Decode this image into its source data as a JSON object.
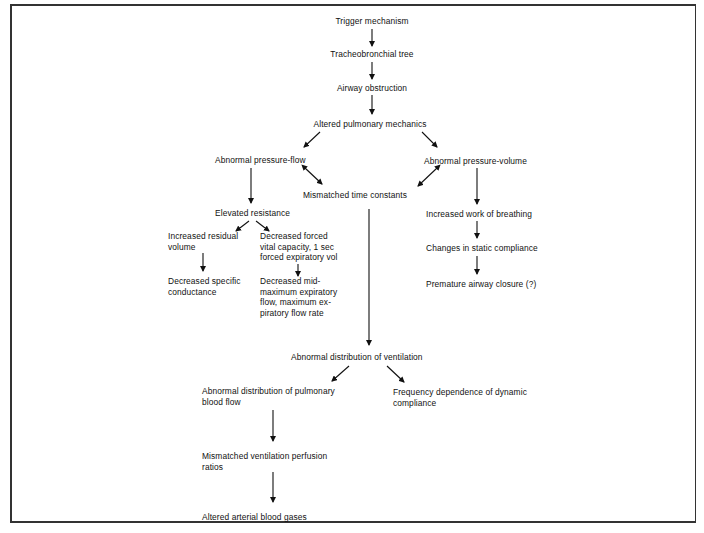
{
  "diagram": {
    "type": "flowchart",
    "nodes": {
      "trigger": "Trigger mechanism",
      "tracheo": "Tracheobronchial  tree",
      "airway": "Airway obstruction",
      "altered_mech": "Altered pulmonary mechanics",
      "abn_pf": "Abnormal pressure-flow",
      "abn_pv": "Abnormal pressure-volume",
      "mismatched_tc": "Mismatched time  constants",
      "elevated_res": "Elevated resistance",
      "inc_rv": "Increased residual\nvolume",
      "dec_fvc": "Decreased forced\nvital capacity, 1 sec\nforced expiratory vol",
      "dec_sc": "Decreased specific\nconductance",
      "dec_mmef": "Decreased mid-\nmaximum expiratory\nflow, maximum ex-\npiratory flow rate",
      "inc_wob": "Increased work  of breathing",
      "static_comp": "Changes in static compliance",
      "premature": "Premature airway closure (?)",
      "abn_dist_vent": "Abnormal distribution  of ventilation",
      "abn_dist_blood": "Abnormal distribution of pulmonary\nblood flow",
      "freq_dep": "Frequency dependence of dynamic\ncompliance",
      "mismatched_vp": "Mismatched ventilation perfusion\nratios",
      "altered_abg": "Altered arterial blood gases"
    },
    "edges": [
      [
        "trigger",
        "tracheo"
      ],
      [
        "tracheo",
        "airway"
      ],
      [
        "airway",
        "altered_mech"
      ],
      [
        "altered_mech",
        "abn_pf"
      ],
      [
        "altered_mech",
        "abn_pv"
      ],
      [
        "abn_pf",
        "mismatched_tc",
        "bidirectional"
      ],
      [
        "abn_pv",
        "mismatched_tc",
        "bidirectional"
      ],
      [
        "abn_pf",
        "elevated_res"
      ],
      [
        "elevated_res",
        "inc_rv"
      ],
      [
        "elevated_res",
        "dec_fvc"
      ],
      [
        "inc_rv",
        "dec_sc"
      ],
      [
        "dec_fvc",
        "dec_mmef"
      ],
      [
        "abn_pv",
        "inc_wob"
      ],
      [
        "inc_wob",
        "static_comp"
      ],
      [
        "static_comp",
        "premature"
      ],
      [
        "mismatched_tc",
        "abn_dist_vent"
      ],
      [
        "abn_dist_vent",
        "abn_dist_blood"
      ],
      [
        "abn_dist_vent",
        "freq_dep"
      ],
      [
        "abn_dist_blood",
        "mismatched_vp"
      ],
      [
        "mismatched_vp",
        "altered_abg"
      ]
    ]
  }
}
